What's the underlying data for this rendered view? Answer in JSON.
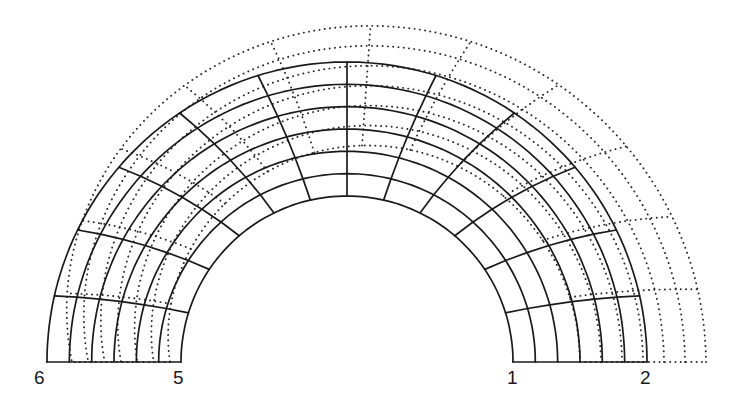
{
  "figure": {
    "colors": {
      "line": "#1a1a1a",
      "background": "#ffffff"
    },
    "center": [
      347,
      362
    ],
    "undeformed_mesh": {
      "style": "solid",
      "inner_radius": 166,
      "outer_radius": 300,
      "radial_layers": 6,
      "circumferential_elements": 12,
      "radial_line_skew_deg": 9
    },
    "deformed_mesh": {
      "style": "dotted",
      "inner_radius_left": 177,
      "outer_radius_left": 275,
      "inner_radius_top": 217,
      "outer_radius_top": 337,
      "inner_radius_right": 233,
      "outer_radius_right": 359,
      "radial_layers": 6,
      "circumferential_elements": 12,
      "angular_shift_deg": -4,
      "radial_line_skew_deg": 9
    },
    "node_labels": [
      {
        "id": "6",
        "x": 34,
        "y": 368
      },
      {
        "id": "5",
        "x": 173,
        "y": 368
      },
      {
        "id": "1",
        "x": 507,
        "y": 368
      },
      {
        "id": "2",
        "x": 640,
        "y": 368
      }
    ]
  }
}
